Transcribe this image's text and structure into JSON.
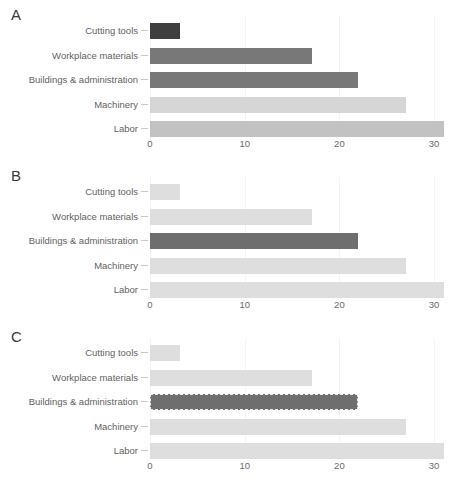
{
  "figure": {
    "width": 470,
    "height": 486,
    "background": "#ffffff"
  },
  "chart_data": [
    {
      "type": "bar",
      "orientation": "horizontal",
      "panel_label": "A",
      "title": "",
      "xlabel": "",
      "ylabel": "",
      "categories": [
        "Cutting tools",
        "Workplace materials",
        "Buildings & administration",
        "Machinery",
        "Labor"
      ],
      "values": [
        3.2,
        17.1,
        22.0,
        27.0,
        31.0
      ],
      "bar_colors": [
        "#3f3f3f",
        "#787878",
        "#787878",
        "#d6d6d6",
        "#c2c2c2"
      ],
      "highlight": null,
      "xlim": [
        0,
        32
      ],
      "xticks": [
        0,
        10,
        20,
        30
      ],
      "xtick_labels": [
        "0",
        "10",
        "20",
        "30"
      ],
      "grid": true,
      "legend": "none"
    },
    {
      "type": "bar",
      "orientation": "horizontal",
      "panel_label": "B",
      "title": "",
      "xlabel": "",
      "ylabel": "",
      "categories": [
        "Cutting tools",
        "Workplace materials",
        "Buildings & administration",
        "Machinery",
        "Labor"
      ],
      "values": [
        3.2,
        17.1,
        22.0,
        27.0,
        31.0
      ],
      "bar_colors": [
        "#dedede",
        "#dedede",
        "#6e6e6e",
        "#dedede",
        "#dedede"
      ],
      "highlight": "Buildings & administration",
      "xlim": [
        0,
        32
      ],
      "xticks": [
        0,
        10,
        20,
        30
      ],
      "xtick_labels": [
        "0",
        "10",
        "20",
        "30"
      ],
      "grid": true,
      "legend": "none"
    },
    {
      "type": "bar",
      "orientation": "horizontal",
      "panel_label": "C",
      "title": "",
      "xlabel": "",
      "ylabel": "",
      "categories": [
        "Cutting tools",
        "Workplace materials",
        "Buildings & administration",
        "Machinery",
        "Labor"
      ],
      "values": [
        3.2,
        17.1,
        22.0,
        27.0,
        31.0
      ],
      "bar_colors": [
        "#dedede",
        "#dedede",
        "#6e6e6e",
        "#dedede",
        "#dedede"
      ],
      "highlight": "Buildings & administration",
      "highlight_style": "dashed-outline",
      "highlight_outline_color": "#f2f2f2",
      "xlim": [
        0,
        32
      ],
      "xticks": [
        0,
        10,
        20,
        30
      ],
      "xtick_labels": [
        "0",
        "10",
        "20",
        "30"
      ],
      "grid": true,
      "legend": "none"
    }
  ]
}
